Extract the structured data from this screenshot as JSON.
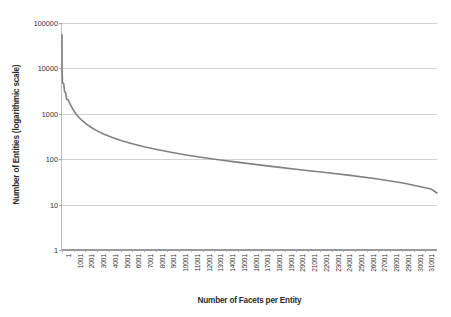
{
  "chart_data": {
    "type": "line",
    "title": "",
    "xlabel": "Number of Facets per Entity",
    "ylabel": "Number of Entities (logarithmic scale)",
    "yscale": "log",
    "ylim": [
      1,
      100000
    ],
    "xlim": [
      1,
      32001
    ],
    "grid": true,
    "legend": "none",
    "series_color": "#808080",
    "gridline_color": "#d2d2d2",
    "ytick_labels": [
      "1",
      "10",
      "100",
      "1000",
      "10000",
      "100000"
    ],
    "ytick_values": [
      1,
      10,
      100,
      1000,
      10000,
      100000
    ],
    "xtick_labels": [
      "1",
      "1001",
      "2001",
      "3001",
      "4001",
      "5001",
      "6001",
      "7001",
      "8001",
      "9001",
      "10001",
      "11001",
      "12001",
      "13001",
      "14001",
      "15001",
      "16001",
      "17001",
      "18001",
      "19001",
      "20001",
      "21001",
      "22001",
      "23001",
      "24001",
      "25001",
      "26001",
      "27001",
      "28001",
      "29001",
      "30001",
      "31001"
    ],
    "xtick_values": [
      1,
      1001,
      2001,
      3001,
      4001,
      5001,
      6001,
      7001,
      8001,
      9001,
      10001,
      11001,
      12001,
      13001,
      14001,
      15001,
      16001,
      17001,
      18001,
      19001,
      20001,
      21001,
      22001,
      23001,
      24001,
      25001,
      26001,
      27001,
      28001,
      29001,
      30001,
      31001
    ],
    "series": [
      {
        "name": "entities per facet count",
        "x": [
          1,
          10,
          40,
          90,
          150,
          220,
          300,
          400,
          520,
          660,
          820,
          1000,
          1200,
          1450,
          1750,
          2100,
          2500,
          3000,
          3600,
          4300,
          5100,
          6000,
          7000,
          8100,
          9300,
          10600,
          12000,
          13500,
          15100,
          16800,
          18600,
          20500,
          22500,
          24600,
          26800,
          29100,
          31500,
          32001
        ],
        "y": [
          55000,
          9800,
          4750,
          4700,
          4600,
          3050,
          2950,
          2100,
          2050,
          1700,
          1420,
          1180,
          990,
          830,
          700,
          590,
          500,
          420,
          355,
          300,
          255,
          218,
          188,
          163,
          142,
          124,
          109,
          96,
          85,
          75,
          66,
          58,
          51,
          44,
          37,
          30,
          22,
          18
        ]
      }
    ]
  }
}
